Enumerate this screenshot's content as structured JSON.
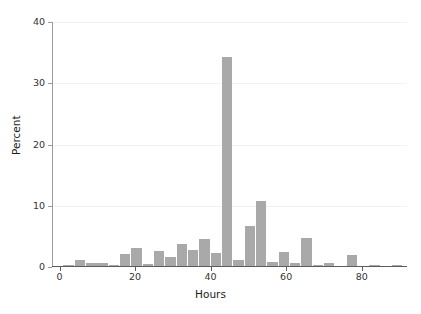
{
  "chart_data": {
    "type": "bar",
    "title": "",
    "subtitle": "",
    "xlabel": "Hours",
    "ylabel": "Percent",
    "xlim": [
      -2,
      92
    ],
    "ylim": [
      0,
      40
    ],
    "grid": true,
    "legend": null,
    "bar_color": "#a9a9a9",
    "bin_width": 3,
    "xticks": [
      0,
      20,
      40,
      60,
      80
    ],
    "xticklabels": [
      "0",
      "20",
      "40",
      "60",
      "80"
    ],
    "yticks": [
      0,
      10,
      20,
      30,
      40
    ],
    "yticklabels": [
      "0",
      "10",
      "20",
      "30",
      "40"
    ],
    "bins": [
      {
        "x0": 1,
        "x1": 4,
        "center": 2.5,
        "value": 0.3
      },
      {
        "x0": 4,
        "x1": 7,
        "center": 5.5,
        "value": 1.1
      },
      {
        "x0": 7,
        "x1": 10,
        "center": 8.5,
        "value": 0.6
      },
      {
        "x0": 10,
        "x1": 13,
        "center": 11.5,
        "value": 0.7
      },
      {
        "x0": 13,
        "x1": 16,
        "center": 14.5,
        "value": 0.3
      },
      {
        "x0": 16,
        "x1": 19,
        "center": 17.5,
        "value": 2.1
      },
      {
        "x0": 19,
        "x1": 22,
        "center": 20.5,
        "value": 3.1
      },
      {
        "x0": 22,
        "x1": 25,
        "center": 23.5,
        "value": 0.5
      },
      {
        "x0": 25,
        "x1": 28,
        "center": 26.5,
        "value": 2.6
      },
      {
        "x0": 28,
        "x1": 31,
        "center": 29.5,
        "value": 1.6
      },
      {
        "x0": 31,
        "x1": 34,
        "center": 32.5,
        "value": 3.7
      },
      {
        "x0": 34,
        "x1": 37,
        "center": 35.5,
        "value": 2.7
      },
      {
        "x0": 37,
        "x1": 40,
        "center": 38.5,
        "value": 4.6
      },
      {
        "x0": 40,
        "x1": 43,
        "center": 41.5,
        "value": 2.3
      },
      {
        "x0": 43,
        "x1": 46,
        "center": 44.5,
        "value": 34.3
      },
      {
        "x0": 46,
        "x1": 49,
        "center": 47.5,
        "value": 1.2
      },
      {
        "x0": 49,
        "x1": 52,
        "center": 50.5,
        "value": 6.7
      },
      {
        "x0": 52,
        "x1": 55,
        "center": 53.5,
        "value": 10.7
      },
      {
        "x0": 55,
        "x1": 58,
        "center": 56.5,
        "value": 0.9
      },
      {
        "x0": 58,
        "x1": 61,
        "center": 59.5,
        "value": 2.4
      },
      {
        "x0": 61,
        "x1": 64,
        "center": 62.5,
        "value": 0.7
      },
      {
        "x0": 64,
        "x1": 67,
        "center": 65.5,
        "value": 4.7
      },
      {
        "x0": 67,
        "x1": 70,
        "center": 68.5,
        "value": 0.35
      },
      {
        "x0": 70,
        "x1": 73,
        "center": 71.5,
        "value": 0.7
      },
      {
        "x0": 73,
        "x1": 76,
        "center": 74.5,
        "value": 0.1
      },
      {
        "x0": 76,
        "x1": 79,
        "center": 77.5,
        "value": 1.9
      },
      {
        "x0": 79,
        "x1": 82,
        "center": 80.5,
        "value": 0.1
      },
      {
        "x0": 82,
        "x1": 85,
        "center": 83.5,
        "value": 0.3
      },
      {
        "x0": 85,
        "x1": 88,
        "center": 86.5,
        "value": 0.05
      },
      {
        "x0": 88,
        "x1": 91,
        "center": 89.5,
        "value": 0.3
      }
    ],
    "data_x": [
      2.5,
      5.5,
      8.5,
      11.5,
      14.5,
      17.5,
      20.5,
      23.5,
      26.5,
      29.5,
      32.5,
      35.5,
      38.5,
      41.5,
      44.5,
      47.5,
      50.5,
      53.5,
      56.5,
      59.5,
      62.5,
      65.5,
      68.5,
      71.5,
      74.5,
      77.5,
      80.5,
      83.5,
      86.5,
      89.5
    ],
    "data_y": [
      0.3,
      1.1,
      0.6,
      0.7,
      0.3,
      2.1,
      3.1,
      0.5,
      2.6,
      1.6,
      3.7,
      2.7,
      4.6,
      2.3,
      34.3,
      1.2,
      6.7,
      10.7,
      0.9,
      2.4,
      0.7,
      4.7,
      0.35,
      0.7,
      0.1,
      1.9,
      0.1,
      0.3,
      0.05,
      0.3
    ],
    "peak": {
      "x": 44.5,
      "y": 34.3
    },
    "second_peak": {
      "x": 53.5,
      "y": 10.7
    }
  }
}
